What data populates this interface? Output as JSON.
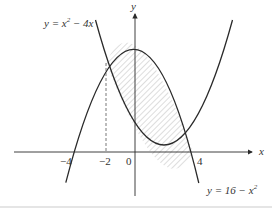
{
  "diagram": {
    "curves": [
      {
        "id": "curve-a",
        "equation_label": "y = x² − 4x",
        "lhs": "y = x",
        "exp": "2",
        "rhs": " − 4x"
      },
      {
        "id": "curve-b",
        "equation_label": "y = 16 − x²",
        "lhs": "y = 16 − x",
        "exp": "2"
      }
    ],
    "axes": {
      "x_label": "x",
      "y_label": "y"
    },
    "ticks": {
      "neg4": "−4",
      "neg2": "−2",
      "zero": "0",
      "four": "4"
    },
    "shaded_region": "between curves from x = −2 to x = 4",
    "colors": {
      "line": "#2a2a2a",
      "hatch": "#aaaaaa",
      "bottom_rule": "#dddddd"
    }
  }
}
